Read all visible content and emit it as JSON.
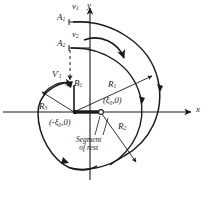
{
  "figure": {
    "kind": "hand-drawn technical diagram",
    "ink_color": "#1a1a1a",
    "background_color": "#ffffff"
  },
  "axes": {
    "x_label": "x",
    "y_label": "y",
    "origin_marker": "open-circle"
  },
  "points": [
    {
      "id": "A1",
      "base": "A",
      "sub": "1",
      "x": 60,
      "y": 18
    },
    {
      "id": "A2",
      "base": "A",
      "sub": "2",
      "x": 60,
      "y": 45
    },
    {
      "id": "B1",
      "base": "B",
      "sub": "1",
      "x": 75,
      "y": 86
    }
  ],
  "velocities": [
    {
      "id": "v1",
      "base": "v",
      "sub": "1",
      "x": 73,
      "y": 9
    },
    {
      "id": "v2",
      "base": "v",
      "sub": "2",
      "x": 73,
      "y": 38
    },
    {
      "id": "V1prime",
      "base": "V",
      "sub": "1",
      "prime": "'",
      "x": 57,
      "y": 75
    }
  ],
  "radii": [
    {
      "id": "R1",
      "base": "R",
      "sub": "1",
      "x": 110,
      "y": 83
    },
    {
      "id": "R2",
      "base": "R",
      "sub": "2",
      "x": 122,
      "y": 125
    },
    {
      "id": "R3",
      "base": "R",
      "sub": "3",
      "x": 42,
      "y": 105
    }
  ],
  "coordinates": [
    {
      "id": "left",
      "text": "(-ξ₀,0)",
      "x": 52,
      "y": 122
    },
    {
      "id": "right",
      "text": "(ξ₀,0)",
      "x": 106,
      "y": 100
    }
  ],
  "annotations": [
    {
      "id": "segment-of-rest",
      "line1": "Segment",
      "line2": "of rest",
      "x": 78,
      "y": 140
    }
  ],
  "rotation_arrow": {
    "direction": "clockwise",
    "position": "upper-center"
  }
}
